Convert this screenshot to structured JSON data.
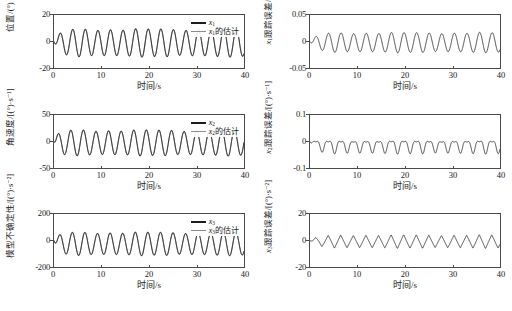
{
  "figure": {
    "background": "#ffffff",
    "axis_color": "#4a4a4a",
    "series_true_color": "#1c1c1c",
    "series_est_color": "#8a8a8a"
  },
  "common": {
    "xlabel": "时间/s",
    "xticks": [
      "0",
      "10",
      "20",
      "30",
      "40"
    ],
    "xlim": [
      0,
      40
    ]
  },
  "panels": [
    {
      "id": "position",
      "ylabel": "位置/(°)",
      "yticks": [
        "20",
        "0",
        "-20"
      ],
      "ylim": [
        -20,
        20
      ],
      "legend": [
        {
          "key": "true",
          "label_main": "x",
          "label_sub": "1",
          "label_tail": ""
        },
        {
          "key": "est",
          "label_main": "x",
          "label_sub": "1",
          "label_tail": "的估计"
        }
      ]
    },
    {
      "id": "x1-tracking-error",
      "ylabel_main": "x",
      "ylabel_sub": "1",
      "ylabel_tail": "跟踪误差/(°)",
      "yticks": [
        "0.05",
        "0",
        "-0.05"
      ],
      "ylim": [
        -0.05,
        0.05
      ],
      "legend": []
    },
    {
      "id": "angular-velocity",
      "ylabel": "角速度/[(°)·s⁻¹]",
      "yticks": [
        "50",
        "0",
        "-50"
      ],
      "ylim": [
        -50,
        50
      ],
      "legend": [
        {
          "key": "true",
          "label_main": "x",
          "label_sub": "2",
          "label_tail": ""
        },
        {
          "key": "est",
          "label_main": "x",
          "label_sub": "2",
          "label_tail": "的估计"
        }
      ]
    },
    {
      "id": "x2-tracking-error",
      "ylabel_main": "x",
      "ylabel_sub": "2",
      "ylabel_tail": "跟踪误差/[(°)·s⁻¹]",
      "yticks": [
        "0.1",
        "0",
        "-0.1"
      ],
      "ylim": [
        -0.1,
        0.1
      ],
      "legend": []
    },
    {
      "id": "model-uncertainty",
      "ylabel": "模型不确定性/[(°)·s⁻²]",
      "yticks": [
        "200",
        "0",
        "-200"
      ],
      "ylim": [
        -200,
        200
      ],
      "legend": [
        {
          "key": "true",
          "label_main": "x",
          "label_sub": "3",
          "label_tail": ""
        },
        {
          "key": "est",
          "label_main": "x",
          "label_sub": "3",
          "label_tail": "的估计"
        }
      ]
    },
    {
      "id": "x3-tracking-error",
      "ylabel_main": "x",
      "ylabel_sub": "3",
      "ylabel_tail": "跟踪误差/[(°)·s⁻²]",
      "yticks": [
        "20",
        "0",
        "-20"
      ],
      "ylim": [
        -20,
        20
      ],
      "legend": []
    }
  ],
  "chart_data": [
    {
      "type": "line",
      "id": "position",
      "title": "",
      "xlabel": "时间/s",
      "ylabel": "位置/(°)",
      "xlim": [
        0,
        40
      ],
      "ylim": [
        -20,
        20
      ],
      "xticks": [
        0,
        10,
        20,
        30,
        40
      ],
      "yticks": [
        -20,
        0,
        20
      ],
      "grid": false,
      "legend_position": "top-right",
      "series": [
        {
          "name": "x1",
          "color": "#1c1c1c",
          "wave": {
            "form": "sine",
            "amplitude": 10,
            "period": 2.65,
            "offset": -1.0,
            "phase": -1.5,
            "ramp_in": 1.2
          }
        },
        {
          "name": "x1的估计",
          "color": "#8a8a8a",
          "wave": {
            "form": "sine",
            "amplitude": 10,
            "period": 2.65,
            "offset": -1.0,
            "phase": -1.5,
            "ramp_in": 1.2
          }
        }
      ]
    },
    {
      "type": "line",
      "id": "x1-tracking-error",
      "title": "",
      "xlabel": "时间/s",
      "ylabel": "x1跟踪误差/(°)",
      "xlim": [
        0,
        40
      ],
      "ylim": [
        -0.05,
        0.05
      ],
      "xticks": [
        0,
        10,
        20,
        30,
        40
      ],
      "yticks": [
        -0.05,
        0,
        0.05
      ],
      "grid": false,
      "legend_position": "none",
      "series": [
        {
          "name": "x1跟踪误差",
          "color": "#1c1c1c",
          "wave": {
            "form": "sine",
            "amplitude": 0.018,
            "period": 2.65,
            "offset": -0.002,
            "phase": -1.4,
            "ramp_in": 1.5
          }
        }
      ]
    },
    {
      "type": "line",
      "id": "angular-velocity",
      "title": "",
      "xlabel": "时间/s",
      "ylabel": "角速度/[(°)·s⁻¹]",
      "xlim": [
        0,
        40
      ],
      "ylim": [
        -50,
        50
      ],
      "xticks": [
        0,
        10,
        20,
        30,
        40
      ],
      "yticks": [
        -50,
        0,
        50
      ],
      "grid": false,
      "legend_position": "top-right",
      "series": [
        {
          "name": "x2",
          "color": "#1c1c1c",
          "wave": {
            "form": "sine",
            "amplitude": 23,
            "period": 2.65,
            "offset": -2.5,
            "phase": -0.55,
            "ramp_in": 0.8
          }
        },
        {
          "name": "x2的估计",
          "color": "#8a8a8a",
          "wave": {
            "form": "sine",
            "amplitude": 23,
            "period": 2.65,
            "offset": -2.5,
            "phase": -0.55,
            "ramp_in": 0.8
          }
        }
      ]
    },
    {
      "type": "line",
      "id": "x2-tracking-error",
      "title": "",
      "xlabel": "时间/s",
      "ylabel": "x2跟踪误差/[(°)·s⁻¹]",
      "xlim": [
        0,
        40
      ],
      "ylim": [
        -0.1,
        0.1
      ],
      "xticks": [
        0,
        10,
        20,
        30,
        40
      ],
      "yticks": [
        -0.1,
        0,
        0.1
      ],
      "grid": false,
      "legend_position": "none",
      "series": [
        {
          "name": "x2跟踪误差",
          "color": "#1c1c1c",
          "wave": {
            "form": "cusp",
            "amplitude": 0.028,
            "period": 2.65,
            "offset": -0.013,
            "phase": -1.3,
            "ramp_in": 1.2
          }
        }
      ]
    },
    {
      "type": "line",
      "id": "model-uncertainty",
      "title": "",
      "xlabel": "时间/s",
      "ylabel": "模型不确定性/[(°)·s⁻²]",
      "xlim": [
        0,
        40
      ],
      "ylim": [
        -200,
        200
      ],
      "xticks": [
        0,
        10,
        20,
        30,
        40
      ],
      "yticks": [
        -200,
        0,
        200
      ],
      "grid": false,
      "legend_position": "top-right",
      "series": [
        {
          "name": "x3",
          "color": "#1c1c1c",
          "wave": {
            "form": "sine",
            "amplitude": 83,
            "period": 2.65,
            "offset": -25,
            "phase": -1.3,
            "ramp_in": 1.0
          }
        },
        {
          "name": "x3的估计",
          "color": "#8a8a8a",
          "wave": {
            "form": "sine",
            "amplitude": 83,
            "period": 2.65,
            "offset": -25,
            "phase": -1.3,
            "ramp_in": 1.0
          }
        }
      ]
    },
    {
      "type": "line",
      "id": "x3-tracking-error",
      "title": "",
      "xlabel": "时间/s",
      "ylabel": "x3跟踪误差/[(°)·s⁻²]",
      "xlim": [
        0,
        40
      ],
      "ylim": [
        -20,
        20
      ],
      "xticks": [
        0,
        10,
        20,
        30,
        40
      ],
      "yticks": [
        -20,
        0,
        20
      ],
      "grid": false,
      "legend_position": "none",
      "series": [
        {
          "name": "x3跟踪误差",
          "color": "#1c1c1c",
          "wave": {
            "form": "triangle",
            "amplitude": 5.0,
            "period": 2.65,
            "offset": -0.8,
            "phase": -1.2,
            "ramp_in": 1.6
          }
        }
      ]
    }
  ]
}
